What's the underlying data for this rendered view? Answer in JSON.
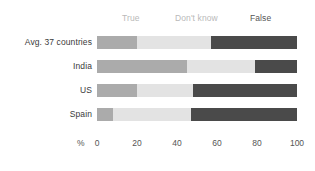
{
  "chart_data": {
    "type": "bar",
    "subtype": "stacked-horizontal-100pct",
    "title": "",
    "xlabel": "%",
    "ylabel": "",
    "xlim": [
      0,
      100
    ],
    "xticks": [
      0,
      20,
      40,
      60,
      80,
      100
    ],
    "xtick_labels": [
      "0",
      "20",
      "40",
      "60",
      "80",
      "100"
    ],
    "grid": false,
    "legend_position": "top",
    "categories": [
      "Avg. 37 countries",
      "India",
      "US",
      "Spain"
    ],
    "series": [
      {
        "name": "True",
        "color": "#ababab",
        "values": [
          20,
          45,
          20,
          8
        ]
      },
      {
        "name": "Don't know",
        "color": "#e3e3e3",
        "values": [
          37,
          34,
          28,
          39
        ]
      },
      {
        "name": "False",
        "color": "#4a4a4a",
        "values": [
          43,
          21,
          52,
          53
        ]
      }
    ]
  },
  "legend": {
    "true_label": "True",
    "dont_know_label": "Don't know",
    "false_label": "False"
  },
  "axis": {
    "unit": "%",
    "ticks": [
      "0",
      "20",
      "40",
      "60",
      "80",
      "100"
    ]
  },
  "rows": [
    {
      "label": "Avg. 37 countries"
    },
    {
      "label": "India"
    },
    {
      "label": "US"
    },
    {
      "label": "Spain"
    }
  ],
  "colors": {
    "true": "#ababab",
    "dont_know": "#e3e3e3",
    "false": "#4a4a4a",
    "background": "#ffffff",
    "text": "#3a3a3a",
    "muted_text": "#b9b9b9"
  }
}
